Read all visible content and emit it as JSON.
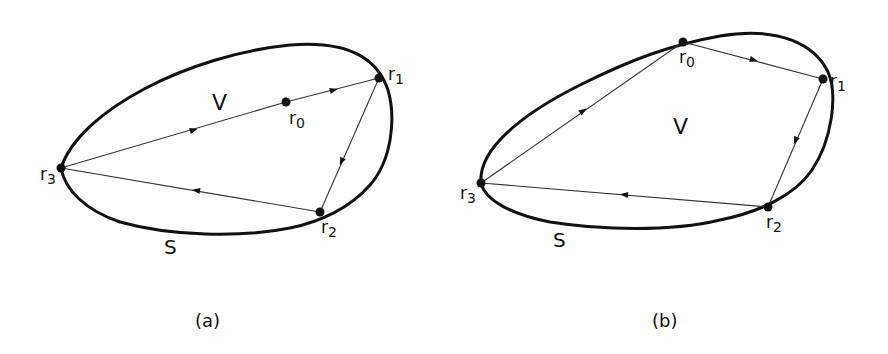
{
  "figure": {
    "panels": [
      {
        "id": "a",
        "caption": "(a)",
        "region_label": "V",
        "surface_label": "S",
        "points": [
          {
            "name": "r",
            "sub": "0"
          },
          {
            "name": "r",
            "sub": "1"
          },
          {
            "name": "r",
            "sub": "2"
          },
          {
            "name": "r",
            "sub": "3"
          }
        ],
        "path_description": "r3 → r0 → r1 → r2 → r3, with r0 inside V on segment r3–r1"
      },
      {
        "id": "b",
        "caption": "(b)",
        "region_label": "V",
        "surface_label": "S",
        "points": [
          {
            "name": "r",
            "sub": "0"
          },
          {
            "name": "r",
            "sub": "1"
          },
          {
            "name": "r",
            "sub": "2"
          },
          {
            "name": "r",
            "sub": "3"
          }
        ],
        "path_description": "r3 → r0 → r1 → r2 → r3, with r0 on boundary S"
      }
    ],
    "colors": {
      "stroke": "#111111",
      "background": "#ffffff"
    }
  }
}
